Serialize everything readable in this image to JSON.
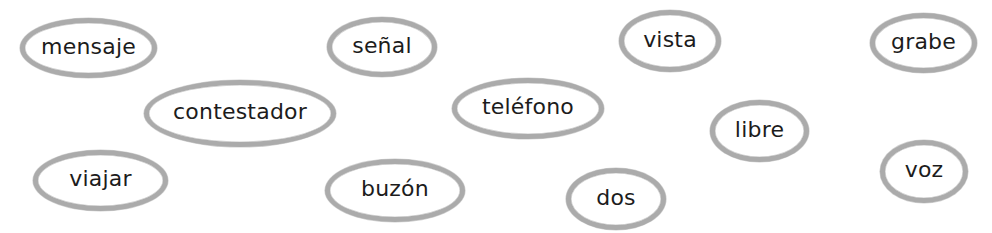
{
  "words": [
    {
      "label": "mensaje",
      "x": 20,
      "y": 18,
      "w": 137,
      "h": 60
    },
    {
      "label": "señal",
      "x": 327,
      "y": 17,
      "w": 110,
      "h": 60
    },
    {
      "label": "vista",
      "x": 619,
      "y": 10,
      "w": 102,
      "h": 62
    },
    {
      "label": "grabe",
      "x": 870,
      "y": 13,
      "w": 107,
      "h": 60
    },
    {
      "label": "contestador",
      "x": 144,
      "y": 80,
      "w": 192,
      "h": 67
    },
    {
      "label": "teléfono",
      "x": 452,
      "y": 78,
      "w": 152,
      "h": 61
    },
    {
      "label": "libre",
      "x": 710,
      "y": 100,
      "w": 99,
      "h": 62
    },
    {
      "label": "viajar",
      "x": 33,
      "y": 150,
      "w": 135,
      "h": 61
    },
    {
      "label": "buzón",
      "x": 325,
      "y": 159,
      "w": 140,
      "h": 63
    },
    {
      "label": "dos",
      "x": 566,
      "y": 168,
      "w": 100,
      "h": 62
    },
    {
      "label": "voz",
      "x": 880,
      "y": 140,
      "w": 88,
      "h": 63
    }
  ],
  "colors": {
    "ring": "#ababab",
    "text": "#1c1c1c",
    "background": "#ffffff"
  }
}
